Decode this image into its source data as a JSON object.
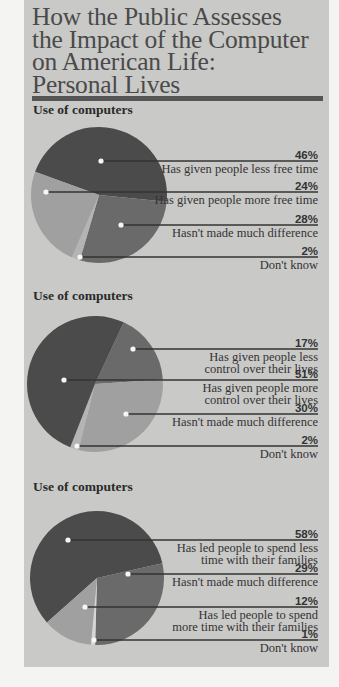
{
  "title": {
    "lines": [
      "How the Public Assesses",
      "the Impact of the Computer",
      "on American Life:",
      "Personal Lives"
    ]
  },
  "colors": {
    "panel": "#c9c9c7",
    "dark": "#4b4b4b",
    "medium": "#6a6a6a",
    "light": "#a0a0a0",
    "sliver": "#b4b4b4",
    "line": "#333333"
  },
  "chart_data": [
    {
      "type": "pie",
      "title": "Use of computers",
      "slices": [
        {
          "label": "Has given people less free time",
          "value": 46,
          "display": "46%"
        },
        {
          "label": "Has given people more free time",
          "value": 24,
          "display": "24%"
        },
        {
          "label": "Hasn't made much difference",
          "value": 28,
          "display": "28%"
        },
        {
          "label": "Don't know",
          "value": 2,
          "display": "2%"
        }
      ]
    },
    {
      "type": "pie",
      "title": "Use of computers",
      "slices": [
        {
          "label": "Has given people less control over their lives",
          "value": 17,
          "display": "17%"
        },
        {
          "label": "Has given people more control over their lives",
          "value": 51,
          "display": "51%"
        },
        {
          "label": "Hasn't made much difference",
          "value": 30,
          "display": "30%"
        },
        {
          "label": "Don't know",
          "value": 2,
          "display": "2%"
        }
      ]
    },
    {
      "type": "pie",
      "title": "Use of computers",
      "slices": [
        {
          "label": "Has led people to spend less time with their families",
          "value": 58,
          "display": "58%"
        },
        {
          "label": "Hasn't made much difference",
          "value": 29,
          "display": "29%"
        },
        {
          "label": "Has led people to spend more time with their families",
          "value": 12,
          "display": "12%"
        },
        {
          "label": "Don't know",
          "value": 1,
          "display": "1%"
        }
      ]
    }
  ],
  "charts": [
    {
      "heading": "Use of computers",
      "labels": [
        {
          "pct": "46%",
          "lines": [
            "Has given people less free time"
          ]
        },
        {
          "pct": "24%",
          "lines": [
            "Has given people more free time"
          ]
        },
        {
          "pct": "28%",
          "lines": [
            "Hasn't made much difference"
          ]
        },
        {
          "pct": "2%",
          "lines": [
            "Don't know"
          ]
        }
      ]
    },
    {
      "heading": "Use of computers",
      "labels": [
        {
          "pct": "17%",
          "lines": [
            "Has given people less",
            "control over their lives"
          ]
        },
        {
          "pct": "51%",
          "lines": [
            "Has given people more",
            "control over their lives"
          ]
        },
        {
          "pct": "30%",
          "lines": [
            "Hasn't made much difference"
          ]
        },
        {
          "pct": "2%",
          "lines": [
            "Don't know"
          ]
        }
      ]
    },
    {
      "heading": "Use of computers",
      "labels": [
        {
          "pct": "58%",
          "lines": [
            "Has led people to spend less",
            "time with their families"
          ]
        },
        {
          "pct": "29%",
          "lines": [
            "Hasn't made much difference"
          ]
        },
        {
          "pct": "12%",
          "lines": [
            "Has led people to spend",
            "more time with their families"
          ]
        },
        {
          "pct": "1%",
          "lines": [
            "Don't know"
          ]
        }
      ]
    }
  ]
}
